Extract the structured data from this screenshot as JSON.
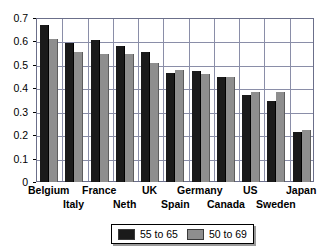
{
  "chart_data": {
    "type": "bar",
    "title": "",
    "subtitle": "",
    "xlabel": "",
    "ylabel": "",
    "ylim": [
      0,
      0.7
    ],
    "ytick_labels": [
      "0.7",
      "0.6",
      "0.5",
      "0.4",
      "0.3",
      "0.2",
      "0.1",
      "0"
    ],
    "ytick_values": [
      0.7,
      0.6,
      0.5,
      0.4,
      0.3,
      0.2,
      0.1,
      0
    ],
    "grid": true,
    "grid_axis": "both",
    "legend_position": "bottom",
    "categories": [
      "Belgium",
      "Italy",
      "France",
      "Neth",
      "UK",
      "Spain",
      "Germany",
      "Canada",
      "US",
      "Sweden",
      "Japan"
    ],
    "series": [
      {
        "name": "55 to 65",
        "color": "#1a1a1a",
        "values": [
          0.67,
          0.595,
          0.605,
          0.58,
          0.553,
          0.465,
          0.473,
          0.45,
          0.37,
          0.345,
          0.215
        ]
      },
      {
        "name": "50 to 69",
        "color": "#8e8e8e",
        "values": [
          0.61,
          0.555,
          0.545,
          0.545,
          0.51,
          0.478,
          0.463,
          0.45,
          0.385,
          0.385,
          0.222
        ]
      }
    ]
  },
  "axes": {
    "y_ticks": [
      {
        "label": "0.7",
        "value": 0.7
      },
      {
        "label": "0.6",
        "value": 0.6
      },
      {
        "label": "0.5",
        "value": 0.5
      },
      {
        "label": "0.4",
        "value": 0.4
      },
      {
        "label": "0.3",
        "value": 0.3
      },
      {
        "label": "0.2",
        "value": 0.2
      },
      {
        "label": "0.1",
        "value": 0.1
      },
      {
        "label": "0",
        "value": 0
      }
    ],
    "x_labels": [
      {
        "text": "Belgium",
        "row": 0
      },
      {
        "text": "Italy",
        "row": 1
      },
      {
        "text": "France",
        "row": 0
      },
      {
        "text": "Neth",
        "row": 1
      },
      {
        "text": "UK",
        "row": 0
      },
      {
        "text": "Spain",
        "row": 1
      },
      {
        "text": "Germany",
        "row": 0
      },
      {
        "text": "Canada",
        "row": 1
      },
      {
        "text": "US",
        "row": 0
      },
      {
        "text": "Sweden",
        "row": 1
      },
      {
        "text": "Japan",
        "row": 0
      }
    ]
  },
  "legend": {
    "entries": [
      {
        "label": "55 to 65",
        "color": "#1a1a1a"
      },
      {
        "label": "50 to 69",
        "color": "#8e8e8e"
      }
    ]
  }
}
